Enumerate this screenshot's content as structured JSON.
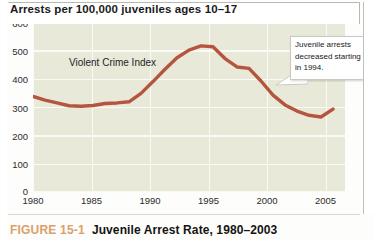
{
  "figure": {
    "chart_title": "Arrests per 100,000 juveniles ages 10–17",
    "caption_number": "FIGURE 15-1",
    "caption_title": "Juvenile Arrest Rate, 1980–2003"
  },
  "annotation": {
    "callout_text": "Juvenile arrests decreased starting in 1994."
  },
  "colors": {
    "series_line": "#b5553f",
    "plot_background": "#e9e9da",
    "gridline": "#fbfbf6",
    "caption_number": "#d9a169",
    "text": "#1a1a1a"
  },
  "chart_data": {
    "type": "line",
    "title": "Arrests per 100,000 juveniles ages 10–17",
    "xlabel": "",
    "ylabel": "Arrests per 100,000 juveniles ages 10–17",
    "xlim": [
      1980,
      2006
    ],
    "ylim": [
      0,
      600
    ],
    "ytick_labels": [
      "0",
      "100",
      "200",
      "300",
      "400",
      "500",
      "600"
    ],
    "yticks": [
      0,
      100,
      200,
      300,
      400,
      500,
      600
    ],
    "xtick_labels": [
      "1980",
      "1985",
      "1990",
      "1995",
      "2000",
      "2005"
    ],
    "xticks": [
      1980,
      1985,
      1990,
      1995,
      2000,
      2005
    ],
    "grid": true,
    "legend_position": "inline-label",
    "series": [
      {
        "name": "Violent Crime Index",
        "color": "#b5553f",
        "x": [
          1980,
          1981,
          1982,
          1983,
          1984,
          1985,
          1986,
          1987,
          1988,
          1989,
          1990,
          1991,
          1992,
          1993,
          1994,
          1995,
          1996,
          1997,
          1998,
          1999,
          2000,
          2001,
          2002,
          2003,
          2004,
          2005
        ],
        "values": [
          335,
          322,
          312,
          302,
          300,
          303,
          310,
          312,
          316,
          346,
          388,
          432,
          473,
          500,
          515,
          512,
          470,
          440,
          435,
          390,
          340,
          305,
          283,
          268,
          262,
          290
        ]
      }
    ],
    "annotations": [
      {
        "text": "Violent Crime Index",
        "x": 1986.5,
        "y": 430,
        "kind": "series-label"
      },
      {
        "text": "Juvenile arrests decreased starting in 1994.",
        "x": 2005,
        "y": 520,
        "kind": "callout"
      }
    ]
  }
}
